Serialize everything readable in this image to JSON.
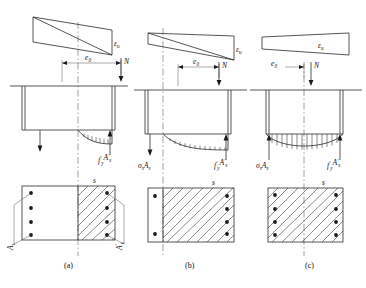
{
  "figure": {
    "caption_labels": [
      "(a)",
      "(b)",
      "(c)"
    ]
  },
  "symbols": {
    "eps_u": "ε",
    "eps_u_sub": "u",
    "e0": "e",
    "e0_sub": "0",
    "N": "N",
    "s": "s",
    "sigma": "σ",
    "sigma_sub": "s",
    "A": "A",
    "A_sub": "s",
    "f": "f",
    "f_sub": "y",
    "prime": "′"
  },
  "panels": [
    {
      "id": "a",
      "caption": "(a)",
      "strain_label": "εu",
      "ecc_label": "e0",
      "load_label": "N",
      "left_force_label": null,
      "right_force_label": "f′yA′s",
      "section_width_label": "s",
      "left_rebar_label": "As",
      "right_rebar_label": "A′s",
      "left_rebar_count": 4,
      "right_rebar_count": 4,
      "hatch_fraction": 0.5,
      "stress_block": "partial-parabolic",
      "strain_sign_change": true,
      "section_type": "T-section"
    },
    {
      "id": "b",
      "caption": "(b)",
      "strain_label": "εu",
      "ecc_label": "e0",
      "load_label": "N",
      "left_force_label": "σsAs",
      "right_force_label": "f′yA′s",
      "section_width_label": "s",
      "left_rebar_label": null,
      "right_rebar_label": null,
      "left_rebar_count": 2,
      "right_rebar_count": 4,
      "hatch_fraction": 0.82,
      "stress_block": "wide-parabolic",
      "strain_sign_change": true,
      "section_type": "rectangular"
    },
    {
      "id": "c",
      "caption": "(c)",
      "strain_label": "εu",
      "ecc_label": "e0",
      "load_label": "N",
      "left_force_label": "σsAs",
      "right_force_label": "f′yA′s",
      "section_width_label": "s",
      "left_rebar_label": null,
      "right_rebar_label": null,
      "left_rebar_count": 4,
      "right_rebar_count": 4,
      "hatch_fraction": 1.0,
      "stress_block": "full-section",
      "strain_sign_change": false,
      "section_type": "rectangular"
    }
  ],
  "colors": {
    "line": "#2b2b2b",
    "thin_line": "#555555",
    "background": "#ffffff",
    "rebar": "#1a1a1a"
  }
}
